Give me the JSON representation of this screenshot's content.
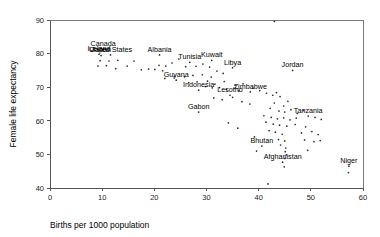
{
  "chart_data": {
    "type": "scatter",
    "title": "",
    "xlabel": "Births per 1000 population",
    "ylabel": "Female life expectancy",
    "xlim": [
      0,
      60
    ],
    "ylim": [
      40,
      90
    ],
    "xticks": [
      0,
      10,
      20,
      30,
      40,
      50,
      60
    ],
    "yticks": [
      40,
      50,
      60,
      70,
      80,
      90
    ],
    "grid": false,
    "legend": null,
    "marker": "small-dot",
    "points": [
      {
        "x": 10.2,
        "y": 81.3,
        "label": "Canada"
      },
      {
        "x": 9.4,
        "y": 79.8,
        "label": "Iceland"
      },
      {
        "x": 9.8,
        "y": 79.4,
        "label": "Japan"
      },
      {
        "x": 11.6,
        "y": 79.6,
        "label": "United States"
      },
      {
        "x": 21.0,
        "y": 79.6,
        "label": "Albania"
      },
      {
        "x": 26.8,
        "y": 77.4,
        "label": "Tunisia"
      },
      {
        "x": 31.0,
        "y": 78.0,
        "label": "Kuwait"
      },
      {
        "x": 35.0,
        "y": 75.8,
        "label": "Libya"
      },
      {
        "x": 24.2,
        "y": 72.1,
        "label": "Guyana"
      },
      {
        "x": 28.5,
        "y": 69.1,
        "label": "Indonesia"
      },
      {
        "x": 34.5,
        "y": 67.6,
        "label": "Lesotho"
      },
      {
        "x": 38.4,
        "y": 68.6,
        "label": "Zimbabwe"
      },
      {
        "x": 46.5,
        "y": 75.0,
        "label": "Jordan"
      },
      {
        "x": 28.5,
        "y": 62.6,
        "label": "Gabon"
      },
      {
        "x": 40.6,
        "y": 52.5,
        "label": "Bhutan"
      },
      {
        "x": 44.6,
        "y": 47.7,
        "label": "Afghanistan"
      },
      {
        "x": 49.5,
        "y": 61.4,
        "label": "Tanzania"
      },
      {
        "x": 57.3,
        "y": 46.5,
        "label": "Niger"
      },
      {
        "x": 9.6,
        "y": 77.9,
        "label": ""
      },
      {
        "x": 11.3,
        "y": 77.8,
        "label": ""
      },
      {
        "x": 13.0,
        "y": 78.0,
        "label": ""
      },
      {
        "x": 16.1,
        "y": 77.8,
        "label": ""
      },
      {
        "x": 9.2,
        "y": 76.3,
        "label": ""
      },
      {
        "x": 10.8,
        "y": 76.4,
        "label": ""
      },
      {
        "x": 12.6,
        "y": 75.5,
        "label": ""
      },
      {
        "x": 14.8,
        "y": 76.3,
        "label": ""
      },
      {
        "x": 17.5,
        "y": 75.2,
        "label": ""
      },
      {
        "x": 18.9,
        "y": 75.4,
        "label": ""
      },
      {
        "x": 20.1,
        "y": 75.3,
        "label": ""
      },
      {
        "x": 20.9,
        "y": 76.5,
        "label": ""
      },
      {
        "x": 22.2,
        "y": 76.3,
        "label": ""
      },
      {
        "x": 21.6,
        "y": 74.9,
        "label": ""
      },
      {
        "x": 23.4,
        "y": 77.2,
        "label": ""
      },
      {
        "x": 24.7,
        "y": 78.4,
        "label": ""
      },
      {
        "x": 26.0,
        "y": 76.1,
        "label": ""
      },
      {
        "x": 28.0,
        "y": 76.2,
        "label": ""
      },
      {
        "x": 29.3,
        "y": 76.9,
        "label": ""
      },
      {
        "x": 30.6,
        "y": 76.0,
        "label": ""
      },
      {
        "x": 32.0,
        "y": 74.8,
        "label": ""
      },
      {
        "x": 33.2,
        "y": 74.1,
        "label": ""
      },
      {
        "x": 30.9,
        "y": 73.0,
        "label": ""
      },
      {
        "x": 29.2,
        "y": 73.7,
        "label": ""
      },
      {
        "x": 27.4,
        "y": 73.5,
        "label": ""
      },
      {
        "x": 25.8,
        "y": 73.1,
        "label": ""
      },
      {
        "x": 23.8,
        "y": 73.1,
        "label": ""
      },
      {
        "x": 22.0,
        "y": 72.6,
        "label": ""
      },
      {
        "x": 26.6,
        "y": 71.4,
        "label": ""
      },
      {
        "x": 28.2,
        "y": 71.6,
        "label": ""
      },
      {
        "x": 30.2,
        "y": 71.8,
        "label": ""
      },
      {
        "x": 31.6,
        "y": 70.9,
        "label": ""
      },
      {
        "x": 33.4,
        "y": 71.7,
        "label": ""
      },
      {
        "x": 35.5,
        "y": 70.6,
        "label": ""
      },
      {
        "x": 37.0,
        "y": 71.0,
        "label": ""
      },
      {
        "x": 29.8,
        "y": 70.2,
        "label": ""
      },
      {
        "x": 31.1,
        "y": 69.8,
        "label": ""
      },
      {
        "x": 32.5,
        "y": 69.9,
        "label": ""
      },
      {
        "x": 33.8,
        "y": 69.3,
        "label": ""
      },
      {
        "x": 36.2,
        "y": 68.9,
        "label": ""
      },
      {
        "x": 38.9,
        "y": 69.7,
        "label": ""
      },
      {
        "x": 40.2,
        "y": 69.0,
        "label": ""
      },
      {
        "x": 41.5,
        "y": 68.2,
        "label": ""
      },
      {
        "x": 42.7,
        "y": 67.6,
        "label": ""
      },
      {
        "x": 43.4,
        "y": 68.4,
        "label": ""
      },
      {
        "x": 44.1,
        "y": 67.2,
        "label": ""
      },
      {
        "x": 35.0,
        "y": 67.0,
        "label": ""
      },
      {
        "x": 33.0,
        "y": 66.3,
        "label": ""
      },
      {
        "x": 31.4,
        "y": 66.8,
        "label": ""
      },
      {
        "x": 36.8,
        "y": 65.7,
        "label": ""
      },
      {
        "x": 38.3,
        "y": 65.0,
        "label": ""
      },
      {
        "x": 43.0,
        "y": 65.3,
        "label": ""
      },
      {
        "x": 44.8,
        "y": 64.4,
        "label": ""
      },
      {
        "x": 45.6,
        "y": 65.8,
        "label": ""
      },
      {
        "x": 42.2,
        "y": 63.7,
        "label": ""
      },
      {
        "x": 43.9,
        "y": 62.9,
        "label": ""
      },
      {
        "x": 45.0,
        "y": 62.6,
        "label": ""
      },
      {
        "x": 46.2,
        "y": 63.3,
        "label": ""
      },
      {
        "x": 47.4,
        "y": 62.2,
        "label": ""
      },
      {
        "x": 48.6,
        "y": 63.1,
        "label": ""
      },
      {
        "x": 41.0,
        "y": 61.5,
        "label": ""
      },
      {
        "x": 42.4,
        "y": 61.0,
        "label": ""
      },
      {
        "x": 43.6,
        "y": 60.6,
        "label": ""
      },
      {
        "x": 44.8,
        "y": 60.9,
        "label": ""
      },
      {
        "x": 46.0,
        "y": 60.3,
        "label": ""
      },
      {
        "x": 47.2,
        "y": 60.8,
        "label": ""
      },
      {
        "x": 50.8,
        "y": 61.0,
        "label": ""
      },
      {
        "x": 52.0,
        "y": 60.4,
        "label": ""
      },
      {
        "x": 41.4,
        "y": 59.6,
        "label": ""
      },
      {
        "x": 42.8,
        "y": 59.0,
        "label": ""
      },
      {
        "x": 44.0,
        "y": 58.7,
        "label": ""
      },
      {
        "x": 45.4,
        "y": 58.4,
        "label": ""
      },
      {
        "x": 47.0,
        "y": 58.9,
        "label": ""
      },
      {
        "x": 49.0,
        "y": 58.2,
        "label": ""
      },
      {
        "x": 34.2,
        "y": 59.4,
        "label": ""
      },
      {
        "x": 36.0,
        "y": 57.8,
        "label": ""
      },
      {
        "x": 42.0,
        "y": 57.1,
        "label": ""
      },
      {
        "x": 43.2,
        "y": 56.6,
        "label": ""
      },
      {
        "x": 44.5,
        "y": 56.0,
        "label": ""
      },
      {
        "x": 48.2,
        "y": 56.4,
        "label": ""
      },
      {
        "x": 50.2,
        "y": 56.8,
        "label": ""
      },
      {
        "x": 51.4,
        "y": 55.9,
        "label": ""
      },
      {
        "x": 39.2,
        "y": 55.2,
        "label": ""
      },
      {
        "x": 43.8,
        "y": 54.4,
        "label": ""
      },
      {
        "x": 45.0,
        "y": 54.0,
        "label": ""
      },
      {
        "x": 48.8,
        "y": 54.3,
        "label": ""
      },
      {
        "x": 50.6,
        "y": 53.8,
        "label": ""
      },
      {
        "x": 51.8,
        "y": 54.1,
        "label": ""
      },
      {
        "x": 44.2,
        "y": 52.8,
        "label": ""
      },
      {
        "x": 45.2,
        "y": 51.9,
        "label": ""
      },
      {
        "x": 45.1,
        "y": 50.8,
        "label": ""
      },
      {
        "x": 45.3,
        "y": 49.9,
        "label": ""
      },
      {
        "x": 49.4,
        "y": 51.2,
        "label": ""
      },
      {
        "x": 39.6,
        "y": 51.0,
        "label": ""
      },
      {
        "x": 45.0,
        "y": 48.8,
        "label": ""
      },
      {
        "x": 44.9,
        "y": 46.3,
        "label": ""
      },
      {
        "x": 57.2,
        "y": 44.6,
        "label": ""
      },
      {
        "x": 41.8,
        "y": 41.2,
        "label": ""
      },
      {
        "x": 43.0,
        "y": 89.6,
        "label": ""
      }
    ]
  }
}
